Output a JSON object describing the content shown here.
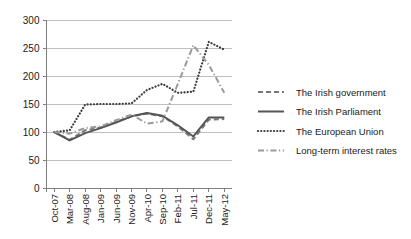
{
  "chart_data": {
    "type": "line",
    "title": "",
    "xlabel": "",
    "ylabel": "",
    "ylim": [
      0,
      300
    ],
    "ytick_values": [
      0,
      50,
      100,
      150,
      200,
      250,
      300
    ],
    "ytick_labels": [
      "0",
      "50",
      "100",
      "150",
      "200",
      "250",
      "300"
    ],
    "grid": true,
    "legend_position": "right",
    "categories": [
      "Oct-07",
      "Mar-08",
      "Aug-08",
      "Jan-09",
      "Jun-09",
      "Nov-09",
      "Apr-10",
      "Sep-10",
      "Feb-11",
      "Jul-11",
      "Dec-11",
      "May-12"
    ],
    "series": [
      {
        "name": "The Irish government",
        "style": "dashed",
        "color": "#777777",
        "values": [
          100,
          86,
          103,
          108,
          118,
          128,
          133,
          128,
          110,
          87,
          122,
          123
        ]
      },
      {
        "name": "The Irish Parliament",
        "style": "solid",
        "color": "#555555",
        "values": [
          100,
          85,
          98,
          107,
          117,
          128,
          134,
          129,
          112,
          92,
          126,
          126
        ]
      },
      {
        "name": "The European Union",
        "style": "dotted",
        "color": "#3a3a3a",
        "values": [
          100,
          103,
          149,
          150,
          150,
          151,
          175,
          186,
          170,
          172,
          261,
          247
        ]
      },
      {
        "name": "Long-term interest rates",
        "style": "dashdot",
        "color": "#9a9a9a",
        "values": [
          100,
          97,
          107,
          110,
          121,
          131,
          115,
          119,
          186,
          255,
          220,
          170
        ]
      }
    ]
  },
  "legend": {
    "items": [
      {
        "label": "The Irish government",
        "swatch": "dashed-line-swatch"
      },
      {
        "label": "The Irish Parliament",
        "swatch": "solid-line-swatch"
      },
      {
        "label": "The European Union",
        "swatch": "dotted-line-swatch"
      },
      {
        "label": "Long-term interest rates",
        "swatch": "dashdot-line-swatch"
      }
    ]
  },
  "colors": {
    "axis": "#7f7f7f",
    "grid": "#bfbfbf",
    "text": "#1a1a1a",
    "background": "#ffffff"
  }
}
